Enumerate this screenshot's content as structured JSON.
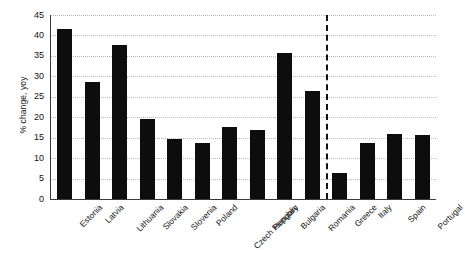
{
  "chart_data": {
    "type": "bar",
    "title": "",
    "subtitle": "",
    "xlabel": "",
    "ylabel": "% change, yoy",
    "ylim": [
      0,
      45
    ],
    "yticks": [
      0,
      5,
      10,
      15,
      20,
      25,
      30,
      35,
      40,
      45
    ],
    "grid": true,
    "legend": null,
    "bar_color": "#0d0d0d",
    "categories": [
      "Estonia",
      "Latvia",
      "Lithuania",
      "Slovakia",
      "Slovenia",
      "Poland",
      "Czech Republic",
      "Hungary",
      "Bulgaria",
      "Romania",
      "Greece",
      "Italy",
      "Spain",
      "Portugal"
    ],
    "values": [
      41.5,
      28.7,
      37.7,
      19.5,
      14.7,
      13.7,
      17.6,
      16.8,
      35.8,
      26.4,
      6.3,
      13.7,
      15.8,
      15.6
    ],
    "annotations": [
      {
        "name": "group-divider",
        "type": "vertical-dashed-line",
        "after_category": "Romania",
        "style": "dashed"
      }
    ]
  },
  "axis": {
    "y_title": "% change, yoy"
  }
}
